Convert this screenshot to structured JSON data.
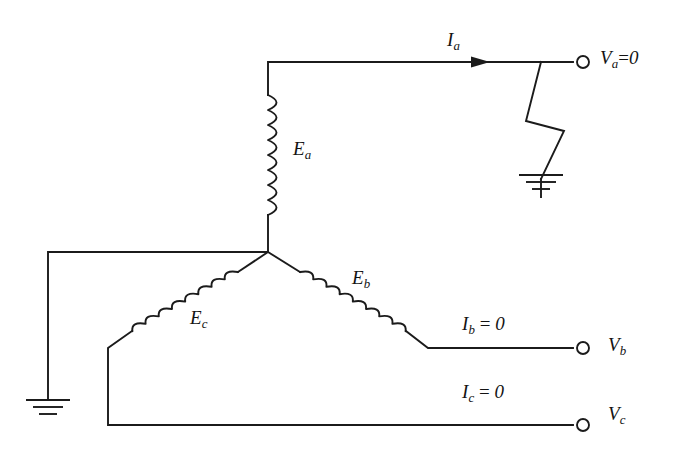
{
  "figure": {
    "background_color": "#ffffff",
    "line_color": "#1b1b1b"
  },
  "labels": {
    "current_a": {
      "symbol": "I",
      "subscript": "a",
      "text": "Ia"
    },
    "voltage_a": {
      "symbol": "V",
      "subscript": "a",
      "equals": "=",
      "value": "0",
      "text": "Va=0"
    },
    "emf_a": {
      "symbol": "E",
      "subscript": "a",
      "text": "Ea"
    },
    "emf_b": {
      "symbol": "E",
      "subscript": "b",
      "text": "Eb"
    },
    "emf_c": {
      "symbol": "E",
      "subscript": "c",
      "text": "Ec"
    },
    "current_b": {
      "symbol": "I",
      "subscript": "b",
      "equals": "=",
      "value": "0",
      "text": "Ib = 0"
    },
    "voltage_b": {
      "symbol": "V",
      "subscript": "b",
      "text": "Vb"
    },
    "current_c": {
      "symbol": "I",
      "subscript": "c",
      "equals": "=",
      "value": "0",
      "text": "Ic = 0"
    },
    "voltage_c": {
      "symbol": "V",
      "subscript": "c",
      "text": "Vc"
    }
  },
  "components": {
    "coil_a": {
      "name": "phase-a-winding",
      "turns": 8,
      "orientation": "vertical"
    },
    "coil_b": {
      "name": "phase-b-winding",
      "turns": 8,
      "orientation": "diagonal-down-right"
    },
    "coil_c": {
      "name": "phase-c-winding",
      "turns": 8,
      "orientation": "diagonal-down-left"
    },
    "fault": {
      "name": "ground-fault-zigzag",
      "phase": "a"
    },
    "ground_fault": {
      "name": "fault-ground-symbol",
      "bars": 3
    },
    "ground_neutral": {
      "name": "neutral-ground-symbol",
      "bars": 3
    },
    "neutral_point": {
      "name": "wye-neutral-junction"
    },
    "terminals": [
      {
        "name": "terminal-a",
        "label": "Va=0"
      },
      {
        "name": "terminal-b",
        "label": "Vb"
      },
      {
        "name": "terminal-c",
        "label": "Vc"
      }
    ]
  }
}
